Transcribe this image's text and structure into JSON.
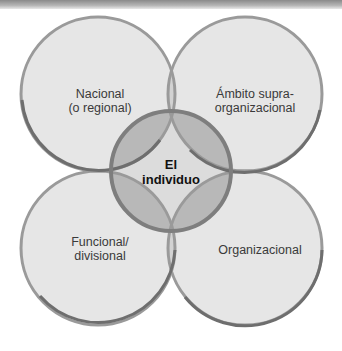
{
  "diagram": {
    "type": "overlapping-circles",
    "circles": [
      {
        "id": "nacional",
        "label": "Nacional\n(o regional)",
        "line1": "Nacional",
        "line2": "(o regional)"
      },
      {
        "id": "supra",
        "label": "Ámbito supra-\norganizacional",
        "line1": "Ámbito supra-",
        "line2": "organizacional"
      },
      {
        "id": "funcional",
        "label": "Funcional/\ndivisional",
        "line1": "Funcional/",
        "line2": "divisional"
      },
      {
        "id": "organizacional",
        "label": "Organizacional",
        "line1": "Organizacional"
      }
    ],
    "center": {
      "label": "El individuo",
      "line1": "El",
      "line2": "individuo"
    },
    "colors": {
      "circle_fill": "#e6e6e6",
      "circle_stroke": "#8c8c8c",
      "overlap_fill": "#c4c4c4",
      "center_fill": "#b3b3b3",
      "center_stroke": "#7a7a7a",
      "center_core": "#d8d8d8"
    }
  }
}
